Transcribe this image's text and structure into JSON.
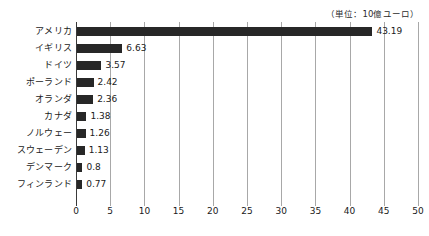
{
  "unit_caption": "（単位：10億ユーロ）",
  "chart_data": {
    "type": "bar",
    "orientation": "horizontal",
    "title": "",
    "xlabel": "",
    "ylabel": "",
    "unit_note": "（単位：10億ユーロ）",
    "xlim": [
      0,
      50
    ],
    "xticks": [
      0,
      5,
      10,
      15,
      20,
      25,
      30,
      35,
      40,
      45,
      50
    ],
    "grid": true,
    "legend": "none",
    "bar_color": "#272727",
    "categories": [
      "アメリカ",
      "イギリス",
      "ドイツ",
      "ポーランド",
      "オランダ",
      "カナダ",
      "ノルウェー",
      "スウェーデン",
      "デンマーク",
      "フィンランド"
    ],
    "values": [
      43.19,
      6.63,
      3.57,
      2.42,
      2.36,
      1.38,
      1.26,
      1.13,
      0.8,
      0.77
    ],
    "value_labels": [
      "43.19",
      "6.63",
      "3.57",
      "2.42",
      "2.36",
      "1.38",
      "1.26",
      "1.13",
      "0.8",
      "0.77"
    ]
  }
}
